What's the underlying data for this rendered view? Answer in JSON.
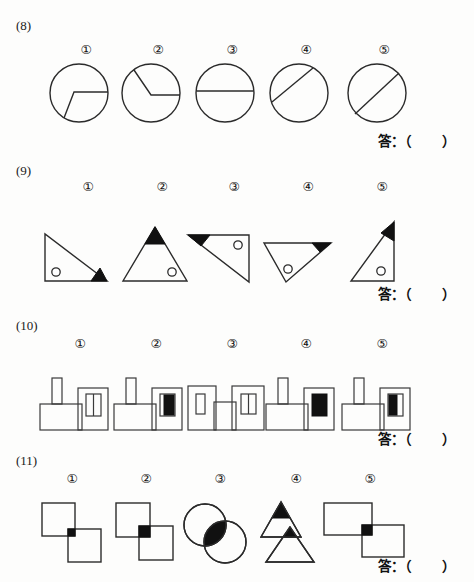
{
  "document": {
    "type": "worksheet",
    "answer_prompt": "答：（      ）"
  },
  "sections": [
    {
      "id": "q8",
      "label": "(8)",
      "label_top": 18,
      "section_top": 0,
      "row_top": 44,
      "row_height": 92,
      "answer_top": 130,
      "figure_type": "circles",
      "items": [
        {
          "num": "①",
          "num_x": 76,
          "num_y": 0,
          "fig_x": 48,
          "fig_y": 18,
          "shape": "circle-bent-chord",
          "note": "horizontal segment from interior vertex to right edge, then bent line down-left to lower-left edge"
        },
        {
          "num": "②",
          "num_x": 148,
          "num_y": 0,
          "fig_x": 120,
          "fig_y": 18,
          "shape": "circle-two-radii",
          "note": "vertex at center, radius to upper-left edge and radius to right edge"
        },
        {
          "num": "③",
          "num_x": 222,
          "num_y": 0,
          "fig_x": 194,
          "fig_y": 18,
          "shape": "circle-horizontal-diameter",
          "note": "horizontal chord slightly above center"
        },
        {
          "num": "④",
          "num_x": 296,
          "num_y": 0,
          "fig_x": 268,
          "fig_y": 18,
          "shape": "circle-chord-diagonal",
          "note": "diagonal chord upper-left region, not through center"
        },
        {
          "num": "⑤",
          "num_x": 374,
          "num_y": 0,
          "fig_x": 346,
          "fig_y": 18,
          "shape": "circle-diagonal-diameter",
          "note": "diagonal diameter through center"
        }
      ]
    },
    {
      "id": "q9",
      "label": "(9)",
      "label_top": 163,
      "section_top": 155,
      "row_top": 26,
      "row_height": 108,
      "answer_top": 128,
      "figure_type": "triangles",
      "items": [
        {
          "num": "①",
          "num_x": 78,
          "num_y": 0,
          "fig_x": 42,
          "fig_y": 50,
          "shape": "right-triangle-left",
          "black_corner": "bottom-right",
          "circle_pos": "bottom-left"
        },
        {
          "num": "②",
          "num_x": 152,
          "num_y": 0,
          "fig_x": 120,
          "fig_y": 42,
          "shape": "isosceles-up",
          "black_corner": "apex-top",
          "circle_pos": "bottom-right"
        },
        {
          "num": "③",
          "num_x": 224,
          "num_y": 0,
          "fig_x": 186,
          "fig_y": 50,
          "shape": "right-triangle-top-right",
          "black_corner": "top-left",
          "circle_pos": "top-right"
        },
        {
          "num": "④",
          "num_x": 298,
          "num_y": 0,
          "fig_x": 262,
          "fig_y": 58,
          "shape": "triangle-down-left",
          "black_corner": "right",
          "circle_pos": "bottom-center"
        },
        {
          "num": "⑤",
          "num_x": 372,
          "num_y": 0,
          "fig_x": 348,
          "fig_y": 38,
          "shape": "right-triangle-bottom-right",
          "black_corner": "top",
          "circle_pos": "bottom-right"
        }
      ]
    },
    {
      "id": "q10",
      "label": "(10)",
      "label_top": 318,
      "section_top": 310,
      "row_top": 28,
      "row_height": 100,
      "answer_top": 118,
      "figure_type": "factories",
      "items": [
        {
          "num": "①",
          "num_x": 70,
          "num_y": 0,
          "fig_x": 38,
          "fig_y": 34,
          "chimney": true,
          "window": "two-pane-white-white",
          "shape": "left-low-right-tall"
        },
        {
          "num": "②",
          "num_x": 146,
          "num_y": 0,
          "fig_x": 112,
          "fig_y": 34,
          "chimney": true,
          "window": "two-pane-white-black",
          "shape": "left-low-right-tall"
        },
        {
          "num": "③",
          "num_x": 222,
          "num_y": 0,
          "fig_x": 186,
          "fig_y": 34,
          "chimney": false,
          "window": "left-single-right-two-pane",
          "shape": "two-tall-blocks"
        },
        {
          "num": "④",
          "num_x": 296,
          "num_y": 0,
          "fig_x": 264,
          "fig_y": 34,
          "chimney": true,
          "window": "solid-black",
          "shape": "left-low-right-tall"
        },
        {
          "num": "⑤",
          "num_x": 372,
          "num_y": 0,
          "fig_x": 340,
          "fig_y": 34,
          "chimney": true,
          "window": "two-pane-black-white",
          "shape": "left-low-right-tall"
        }
      ]
    },
    {
      "id": "q11",
      "label": "(11)",
      "label_top": 453,
      "section_top": 445,
      "row_top": 28,
      "row_height": 100,
      "answer_top": 110,
      "figure_type": "overlaps",
      "items": [
        {
          "num": "①",
          "num_x": 62,
          "num_y": 0,
          "fig_x": 40,
          "fig_y": 28,
          "shape": "two-squares-small-overlap",
          "overlap_fill": "black"
        },
        {
          "num": "②",
          "num_x": 136,
          "num_y": 0,
          "fig_x": 114,
          "fig_y": 28,
          "shape": "two-squares-large-overlap",
          "overlap_fill": "black"
        },
        {
          "num": "③",
          "num_x": 210,
          "num_y": 0,
          "fig_x": 182,
          "fig_y": 28,
          "shape": "two-circles-overlap",
          "overlap_fill": "black"
        },
        {
          "num": "④",
          "num_x": 286,
          "num_y": 0,
          "fig_x": 258,
          "fig_y": 26,
          "shape": "two-triangles-overlap",
          "overlap_fill": "black"
        },
        {
          "num": "⑤",
          "num_x": 360,
          "num_y": 0,
          "fig_x": 322,
          "fig_y": 28,
          "shape": "two-rectangles-overlap",
          "overlap_fill": "black"
        }
      ]
    }
  ],
  "colors": {
    "ink": "#2b2b2b",
    "fill_black": "#111111",
    "paper": "#fdfdfc"
  }
}
